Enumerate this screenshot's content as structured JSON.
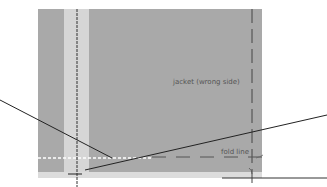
{
  "diagram": {
    "labels": {
      "jacket": "jacket (wrong side)",
      "fold": "fold line"
    },
    "colors": {
      "fabric": "#a9a9a9",
      "strip": "#d6d6d6",
      "line": "#333333",
      "background": "#ffffff"
    }
  }
}
